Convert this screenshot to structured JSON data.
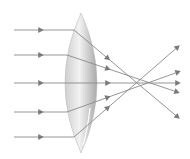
{
  "diagram": {
    "colors": {
      "background": "#ffffff",
      "ray": "#8a8a8a",
      "arrow": "#7a7a7a",
      "lens_light": "#f2f2f2",
      "lens_mid": "#cfcfcf",
      "lens_dark": "#a9a9a9"
    },
    "lens": {
      "cx": 81,
      "top": 13,
      "bottom": 153,
      "half_width": 16
    },
    "rays": [
      {
        "id": "ray-1",
        "start": [
          14,
          30
        ],
        "entry": [
          74,
          30
        ],
        "mid_arrow": [
          108,
          53
        ],
        "end": [
          180,
          119
        ]
      },
      {
        "id": "ray-2",
        "start": [
          14,
          55
        ],
        "entry": [
          67,
          55
        ],
        "mid_arrow": [
          108,
          63
        ],
        "end": [
          180,
          93
        ]
      },
      {
        "id": "ray-3",
        "start": [
          14,
          83
        ],
        "entry": [
          65,
          83
        ],
        "mid_arrow": [
          108,
          83
        ],
        "end": [
          181,
          83
        ]
      },
      {
        "id": "ray-4",
        "start": [
          14,
          112
        ],
        "entry": [
          67,
          112
        ],
        "mid_arrow": [
          108,
          100
        ],
        "end": [
          181,
          71
        ]
      },
      {
        "id": "ray-5",
        "start": [
          14,
          137
        ],
        "entry": [
          74,
          137
        ],
        "mid_arrow": [
          108,
          112
        ],
        "end": [
          180,
          45
        ]
      }
    ],
    "incoming_arrow_x": 41
  }
}
